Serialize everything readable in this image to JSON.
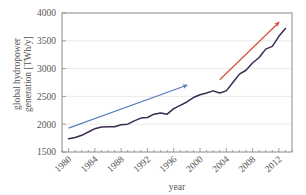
{
  "chart_data": {
    "type": "line",
    "title": "",
    "xlabel": "year",
    "ylabel": "global hydropower generation [TWh/y]",
    "ylabel_line1": "global hydropower",
    "ylabel_line2": "generation [TWh/y]",
    "xlim": [
      1979,
      2014
    ],
    "ylim": [
      1500,
      4000
    ],
    "xticks": [
      1980,
      1984,
      1988,
      1992,
      1996,
      2000,
      2004,
      2008,
      2012
    ],
    "xtick_labels": [
      "1980",
      "1984",
      "1988",
      "1992",
      "1996",
      "2000",
      "2004",
      "2008",
      "2012"
    ],
    "yticks": [
      1500,
      2000,
      2500,
      3000,
      3500,
      4000
    ],
    "ytick_labels": [
      "1500",
      "2000",
      "2500",
      "3000",
      "3500",
      "4000"
    ],
    "grid": true,
    "legend": "none",
    "series": [
      {
        "name": "global hydropower generation",
        "color": "#3b2a4f",
        "x": [
          1980,
          1981,
          1982,
          1983,
          1984,
          1985,
          1986,
          1987,
          1988,
          1989,
          1990,
          1991,
          1992,
          1993,
          1994,
          1995,
          1996,
          1997,
          1998,
          1999,
          2000,
          2001,
          2002,
          2003,
          2004,
          2005,
          2006,
          2007,
          2008,
          2009,
          2010,
          2011,
          2012,
          2013
        ],
        "values": [
          1740,
          1760,
          1800,
          1860,
          1920,
          1950,
          1955,
          1955,
          1990,
          2000,
          2060,
          2110,
          2120,
          2180,
          2200,
          2180,
          2280,
          2340,
          2400,
          2480,
          2530,
          2560,
          2600,
          2560,
          2600,
          2750,
          2900,
          2970,
          3100,
          3200,
          3350,
          3400,
          3580,
          3720
        ]
      }
    ],
    "annotations": [
      {
        "name": "blue-trend-arrow",
        "color": "#5b7fbd",
        "x_start": 1980,
        "y_start": 1930,
        "x_end": 1998,
        "y_end": 2700,
        "style": "arrow"
      },
      {
        "name": "red-trend-arrow",
        "color": "#d94b3a",
        "x_start": 2003,
        "y_start": 2800,
        "x_end": 2012,
        "y_end": 3830,
        "style": "arrow"
      }
    ]
  }
}
